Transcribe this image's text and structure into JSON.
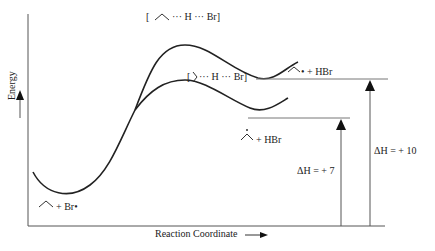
{
  "diagram": {
    "type": "reaction energy profile",
    "axes": {
      "y_label": "Energy",
      "x_label": "Reaction Coordinate"
    },
    "species": {
      "reactants": "+ Br•",
      "ts_primary": "··· H ··· Br]",
      "ts_primary_open": "[",
      "ts_secondary": "··· H ··· Br]",
      "ts_secondary_open": "[",
      "product_primary": "• + HBr",
      "product_secondary": "+ HBr"
    },
    "enthalpy": {
      "primary": "ΔH = + 10",
      "secondary": "ΔH = + 7"
    },
    "colors": {
      "line": "#222222",
      "guide": "#555555"
    }
  }
}
